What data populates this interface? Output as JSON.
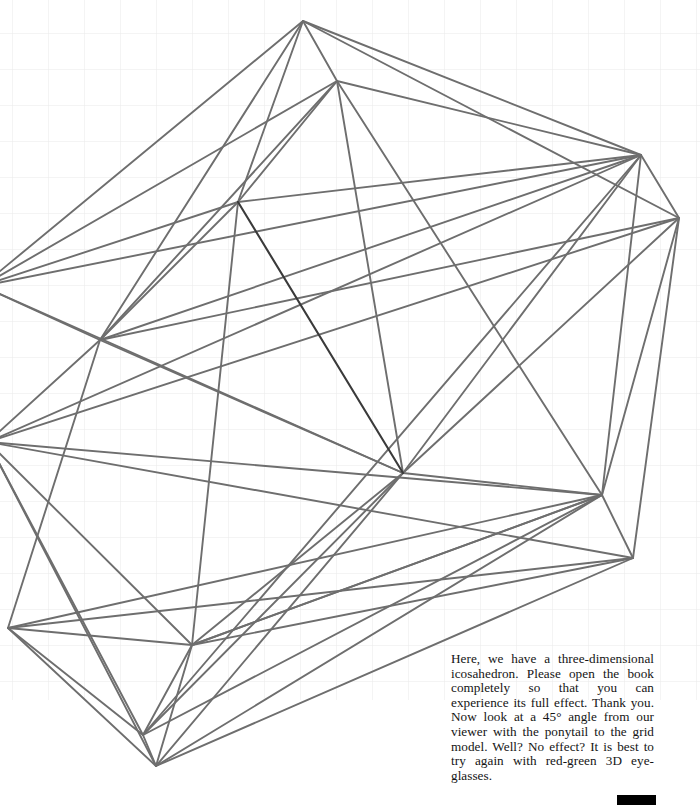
{
  "figure": {
    "name": "3d-icosahedron-wireframe",
    "background_color": "#ffffff",
    "grid": {
      "line_color": "#e9e9e9",
      "spacing_px": 36,
      "offset_x_px": 12,
      "offset_y_px": 33,
      "extent": {
        "x": 0,
        "y": 0,
        "width": 700,
        "height": 700
      }
    },
    "stroke": {
      "normal_color": "#6e6e6e",
      "accent_color": "#3a3a3a",
      "width_px": 1.9
    },
    "vertices": [
      {
        "name": "top-apex-outer",
        "x": 303,
        "y": 21
      },
      {
        "name": "top-apex-inner",
        "x": 337,
        "y": 81
      },
      {
        "name": "upper-right-outer",
        "x": 641,
        "y": 155
      },
      {
        "name": "upper-right-far",
        "x": 679,
        "y": 218
      },
      {
        "name": "upper-left-inner",
        "x": 238,
        "y": 202
      },
      {
        "name": "left-mid-outer",
        "x": 100,
        "y": 340
      },
      {
        "name": "left-edge-upper",
        "x": -18,
        "y": 286
      },
      {
        "name": "left-edge-lower",
        "x": -12,
        "y": 442
      },
      {
        "name": "center-inner",
        "x": 403,
        "y": 473
      },
      {
        "name": "right-mid-inner",
        "x": 602,
        "y": 495
      },
      {
        "name": "right-lower-outer",
        "x": 633,
        "y": 558
      },
      {
        "name": "left-lower-outer",
        "x": 8,
        "y": 628
      },
      {
        "name": "bottom-inner-apex",
        "x": 192,
        "y": 645
      },
      {
        "name": "bottom-apex-inner",
        "x": 143,
        "y": 735
      },
      {
        "name": "bottom-apex-outer",
        "x": 156,
        "y": 766
      }
    ]
  },
  "caption": {
    "text": "Here, we have a three-dimensional icosahedron. Please open the book completely so that you can experience its full effect. Thank you. Now look at a 45° angle from our viewer with the ponytail to the grid model. Well? No effect? It is best to try again with red-green 3D eye-glasses."
  },
  "page_marker": {
    "label": "",
    "color": "#000000"
  }
}
